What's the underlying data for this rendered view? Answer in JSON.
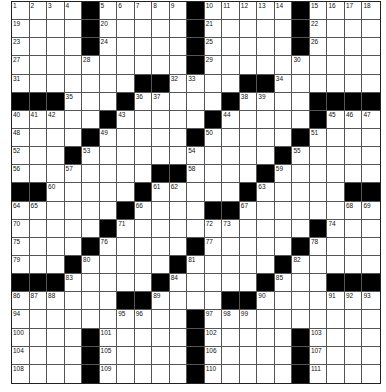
{
  "puzzle": {
    "rows": 21,
    "cols": 21,
    "colors": {
      "black": "#000000",
      "white": "#ffffff",
      "line": "#555555"
    },
    "grid": [
      [
        "1",
        "2",
        "3",
        "4",
        "#",
        "5",
        "6",
        "7",
        "8",
        "9",
        "#",
        "10",
        "11",
        "12",
        "13",
        "14",
        "#",
        "15",
        "16",
        "17",
        "18"
      ],
      [
        "19",
        "",
        "",
        "",
        "#",
        "20",
        "",
        "",
        "",
        "",
        "#",
        "21",
        "",
        "",
        "",
        "",
        "#",
        "22",
        "",
        "",
        ""
      ],
      [
        "23",
        "",
        "",
        "",
        "#",
        "24",
        "",
        "",
        "",
        "",
        "#",
        "25",
        "",
        "",
        "",
        "",
        "#",
        "26",
        "",
        "",
        ""
      ],
      [
        "27",
        "",
        "",
        "",
        "28",
        "",
        "",
        "",
        "",
        "",
        "#",
        "29",
        "",
        "",
        "",
        "",
        "30",
        "",
        "",
        "",
        ""
      ],
      [
        "31",
        "",
        "",
        "",
        "",
        "",
        "",
        "#",
        "#",
        "32",
        "33",
        "",
        "",
        "#",
        "#",
        "34",
        "",
        "",
        "",
        "",
        ""
      ],
      [
        "#",
        "#",
        "#",
        "35",
        "",
        "",
        "#",
        "36",
        "37",
        "",
        "",
        "",
        "#",
        "38",
        "39",
        "",
        "",
        "#",
        "#",
        "#",
        "#"
      ],
      [
        "40",
        "41",
        "42",
        "",
        "",
        "#",
        "43",
        "",
        "",
        "",
        "",
        "#",
        "44",
        "",
        "",
        "",
        "",
        "#",
        "45",
        "46",
        "47"
      ],
      [
        "48",
        "",
        "",
        "",
        "#",
        "49",
        "",
        "",
        "",
        "",
        "#",
        "50",
        "",
        "",
        "",
        "",
        "#",
        "51",
        "",
        "",
        ""
      ],
      [
        "52",
        "",
        "",
        "#",
        "53",
        "",
        "",
        "",
        "",
        "",
        "54",
        "",
        "",
        "",
        "",
        "#",
        "55",
        "",
        "",
        "",
        ""
      ],
      [
        "56",
        "",
        "",
        "57",
        "",
        "",
        "",
        "",
        "#",
        "#",
        "58",
        "",
        "",
        "",
        "#",
        "59",
        "",
        "",
        "",
        "",
        ""
      ],
      [
        "#",
        "#",
        "60",
        "",
        "",
        "",
        "",
        "#",
        "61",
        "62",
        "",
        "",
        "",
        "#",
        "63",
        "",
        "",
        "",
        "",
        "#",
        "#"
      ],
      [
        "64",
        "65",
        "",
        "",
        "",
        "",
        "#",
        "66",
        "",
        "",
        "",
        "#",
        "#",
        "67",
        "",
        "",
        "",
        "",
        "",
        "68",
        "69"
      ],
      [
        "70",
        "",
        "",
        "",
        "",
        "#",
        "71",
        "",
        "",
        "",
        "",
        "72",
        "73",
        "",
        "",
        "",
        "",
        "#",
        "74",
        "",
        ""
      ],
      [
        "75",
        "",
        "",
        "",
        "#",
        "76",
        "",
        "",
        "",
        "",
        "#",
        "77",
        "",
        "",
        "",
        "",
        "#",
        "78",
        "",
        "",
        ""
      ],
      [
        "79",
        "",
        "",
        "#",
        "80",
        "",
        "",
        "",
        "",
        "#",
        "81",
        "",
        "",
        "",
        "",
        "#",
        "82",
        "",
        "",
        "",
        ""
      ],
      [
        "#",
        "#",
        "#",
        "83",
        "",
        "",
        "",
        "",
        "#",
        "84",
        "",
        "",
        "",
        "",
        "#",
        "85",
        "",
        "",
        "#",
        "#",
        "#"
      ],
      [
        "86",
        "87",
        "88",
        "",
        "",
        "",
        "#",
        "#",
        "89",
        "",
        "",
        "",
        "#",
        "#",
        "90",
        "",
        "",
        "",
        "91",
        "92",
        "93"
      ],
      [
        "94",
        "",
        "",
        "",
        "",
        "",
        "95",
        "96",
        "",
        "",
        "#",
        "97",
        "98",
        "99",
        "",
        "",
        "",
        "",
        "",
        "",
        ""
      ],
      [
        "100",
        "",
        "",
        "",
        "#",
        "101",
        "",
        "",
        "",
        "",
        "#",
        "102",
        "",
        "",
        "",
        "",
        "#",
        "103",
        "",
        "",
        ""
      ],
      [
        "104",
        "",
        "",
        "",
        "#",
        "105",
        "",
        "",
        "",
        "",
        "#",
        "106",
        "",
        "",
        "",
        "",
        "#",
        "107",
        "",
        "",
        ""
      ],
      [
        "108",
        "",
        "",
        "",
        "#",
        "109",
        "",
        "",
        "",
        "",
        "#",
        "110",
        "",
        "",
        "",
        "",
        "#",
        "111",
        "",
        "",
        ""
      ]
    ]
  }
}
